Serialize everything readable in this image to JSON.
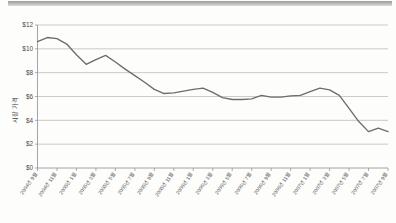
{
  "chart_data": {
    "type": "line",
    "title": "",
    "subtitle": "",
    "xlabel": "",
    "ylabel": "시장 가격",
    "ylim": [
      0,
      12
    ],
    "y_ticks": [
      0,
      2,
      4,
      6,
      8,
      10,
      12
    ],
    "y_tick_labels": [
      "$0",
      "$2",
      "$4",
      "$6",
      "$8",
      "$10",
      "$12"
    ],
    "grid": true,
    "legend": "none",
    "x_tick_labels": [
      "2004년 9월",
      "2004년 11월",
      "2005년 1월",
      "2005년 3월",
      "2005년 5월",
      "2005년 7월",
      "2005년 9월",
      "2005년 11월",
      "2006년 1월",
      "2006년 3월",
      "2006년 5월",
      "2006년 7월",
      "2006년 9월",
      "2006년 11월",
      "2007년 1월",
      "2007년 3월",
      "2007년 5월",
      "2007년 7월",
      "2007년 9월"
    ],
    "x": [
      "2004-09",
      "2004-10",
      "2004-11",
      "2004-12",
      "2005-01",
      "2005-02",
      "2005-03",
      "2005-04",
      "2005-05",
      "2005-06",
      "2005-07",
      "2005-08",
      "2005-09",
      "2005-10",
      "2005-11",
      "2005-12",
      "2006-01",
      "2006-02",
      "2006-03",
      "2006-04",
      "2006-05",
      "2006-06",
      "2006-07",
      "2006-08",
      "2006-09",
      "2006-10",
      "2006-11",
      "2006-12",
      "2007-01",
      "2007-02",
      "2007-03",
      "2007-04",
      "2007-05",
      "2007-06",
      "2007-07",
      "2007-08",
      "2007-09"
    ],
    "values": [
      10.6,
      10.95,
      10.85,
      10.4,
      9.5,
      8.7,
      9.1,
      9.45,
      8.9,
      8.3,
      7.75,
      7.2,
      6.6,
      6.25,
      6.3,
      6.45,
      6.6,
      6.7,
      6.35,
      5.9,
      5.75,
      5.75,
      5.8,
      6.1,
      5.95,
      5.95,
      6.05,
      6.1,
      6.4,
      6.7,
      6.55,
      6.1,
      5.0,
      3.9,
      3.05,
      3.35,
      3.05
    ],
    "series_name": "시장 가격",
    "line_color": "#6d6d6d",
    "grid_color": "#b4b4b4",
    "axis_color": "#8e8e8e",
    "background_color": "#fdfdfc"
  }
}
